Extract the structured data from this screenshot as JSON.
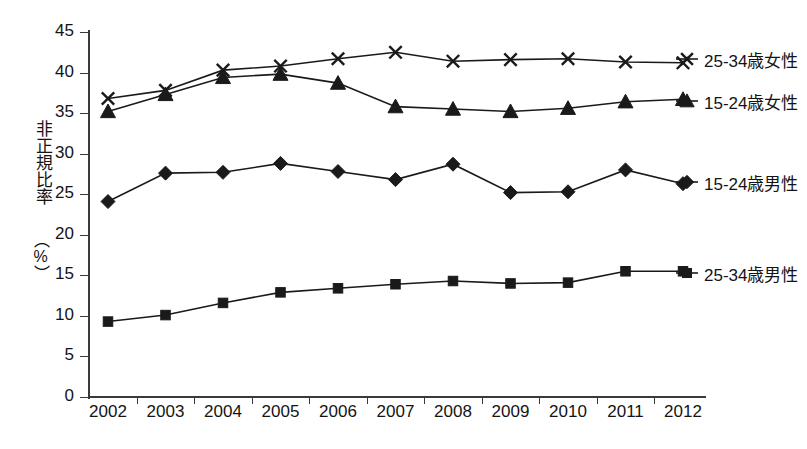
{
  "chart_data": {
    "type": "line",
    "title": "",
    "xlabel": "",
    "ylabel": "非正規比率（%）",
    "ylabel_text": "非正規比率",
    "ylabel_unit": "（%）",
    "categories": [
      "2002",
      "2003",
      "2004",
      "2005",
      "2006",
      "2007",
      "2008",
      "2009",
      "2010",
      "2011",
      "2012"
    ],
    "ylim": [
      0,
      45
    ],
    "ytick_values": [
      0,
      5,
      10,
      15,
      20,
      25,
      30,
      35,
      40,
      45
    ],
    "ytick_labels": [
      "0",
      "5",
      "10",
      "15",
      "20",
      "25",
      "30",
      "35",
      "40",
      "45"
    ],
    "grid": false,
    "legend_position": "right",
    "series": [
      {
        "name": "25-34歳女性",
        "marker": "x",
        "values": [
          36.8,
          37.8,
          40.3,
          40.8,
          41.7,
          42.5,
          41.4,
          41.6,
          41.7,
          41.3,
          41.2
        ]
      },
      {
        "name": "15-24歳女性",
        "marker": "triangle",
        "values": [
          35.2,
          37.3,
          39.4,
          39.8,
          38.7,
          35.8,
          35.5,
          35.2,
          35.6,
          36.4,
          36.7
        ]
      },
      {
        "name": "15-24歳男性",
        "marker": "diamond",
        "values": [
          24.1,
          27.6,
          27.7,
          28.8,
          27.8,
          26.8,
          28.7,
          25.2,
          25.3,
          28.0,
          26.3
        ]
      },
      {
        "name": "25-34歳男性",
        "marker": "square",
        "values": [
          9.3,
          10.1,
          11.6,
          12.9,
          13.4,
          13.9,
          14.3,
          14.0,
          14.1,
          15.5,
          15.5
        ]
      }
    ]
  },
  "legend": {
    "entries": [
      {
        "label": "25-34歳女性",
        "marker": "x"
      },
      {
        "label": "15-24歳女性",
        "marker": "triangle"
      },
      {
        "label": "15-24歳男性",
        "marker": "diamond"
      },
      {
        "label": "25-34歳男性",
        "marker": "square"
      }
    ]
  },
  "colors": {
    "ink": "#1a1a1a",
    "axis": "#3a3a3a",
    "background": "#ffffff"
  }
}
